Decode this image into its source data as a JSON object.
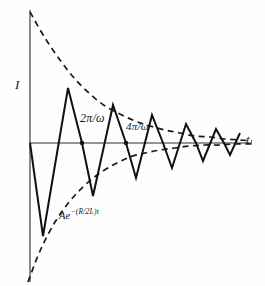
{
  "figure": {
    "background_color": "#fefefe",
    "ink_color": "#111111",
    "axes": {
      "y_axis_label": "I",
      "x_axis_label": "t",
      "origin_px": [
        30,
        143
      ]
    },
    "annotations": {
      "period_first": "2π/ω",
      "period_second": "4π/ω",
      "envelope_prefix": "Ae",
      "envelope_exponent": "−(R/2L)t"
    }
  },
  "chart_data": {
    "type": "line",
    "title": "",
    "subtitle": "",
    "xlabel": "t",
    "ylabel": "I",
    "grid": false,
    "legend": null,
    "axis_ranges": {
      "x_px": [
        30,
        252
      ],
      "y_px": [
        10,
        282
      ],
      "zero_line_y_px": 143
    },
    "series": [
      {
        "name": "damped-current",
        "style": "solid",
        "points_px": [
          [
            30,
            143
          ],
          [
            43,
            236
          ],
          [
            68,
            88
          ],
          [
            82,
            143
          ],
          [
            93,
            196
          ],
          [
            113,
            105
          ],
          [
            126,
            143
          ],
          [
            136,
            178
          ],
          [
            152,
            115
          ],
          [
            163,
            143
          ],
          [
            172,
            168
          ],
          [
            186,
            124
          ],
          [
            196,
            143
          ],
          [
            203,
            161
          ],
          [
            216,
            129
          ],
          [
            224,
            143
          ],
          [
            230,
            155
          ],
          [
            240,
            133
          ]
        ]
      },
      {
        "name": "upper-envelope",
        "style": "dashed",
        "points_px": [
          [
            30,
            12
          ],
          [
            45,
            38
          ],
          [
            60,
            60
          ],
          [
            75,
            79
          ],
          [
            90,
            94
          ],
          [
            105,
            106
          ],
          [
            120,
            114
          ],
          [
            135,
            121
          ],
          [
            150,
            126
          ],
          [
            165,
            130
          ],
          [
            180,
            133
          ],
          [
            195,
            136
          ],
          [
            210,
            137
          ],
          [
            225,
            139
          ],
          [
            240,
            140
          ],
          [
            252,
            141
          ]
        ]
      },
      {
        "name": "lower-envelope",
        "style": "dashed",
        "points_px": [
          [
            28,
            282
          ],
          [
            40,
            251
          ],
          [
            55,
            222
          ],
          [
            70,
            201
          ],
          [
            85,
            185
          ],
          [
            100,
            173
          ],
          [
            115,
            164
          ],
          [
            130,
            157
          ],
          [
            145,
            153
          ],
          [
            160,
            150
          ],
          [
            175,
            148
          ],
          [
            190,
            146
          ],
          [
            205,
            145
          ],
          [
            220,
            145
          ],
          [
            235,
            144
          ],
          [
            252,
            144
          ]
        ]
      }
    ],
    "annotations": [
      {
        "name": "period-marker-1",
        "text": "2π/ω",
        "marker_px": [
          82,
          143
        ],
        "label_px": [
          80,
          112
        ]
      },
      {
        "name": "period-marker-2",
        "text": "4π/ω",
        "marker_px": [
          126,
          143
        ],
        "label_px": [
          126,
          121
        ]
      },
      {
        "name": "envelope-equation",
        "text": "Ae−(R/2L)t",
        "label_px": [
          59,
          208
        ]
      }
    ],
    "axis_tick_dots_px": [
      [
        82,
        143
      ],
      [
        126,
        143
      ]
    ]
  }
}
